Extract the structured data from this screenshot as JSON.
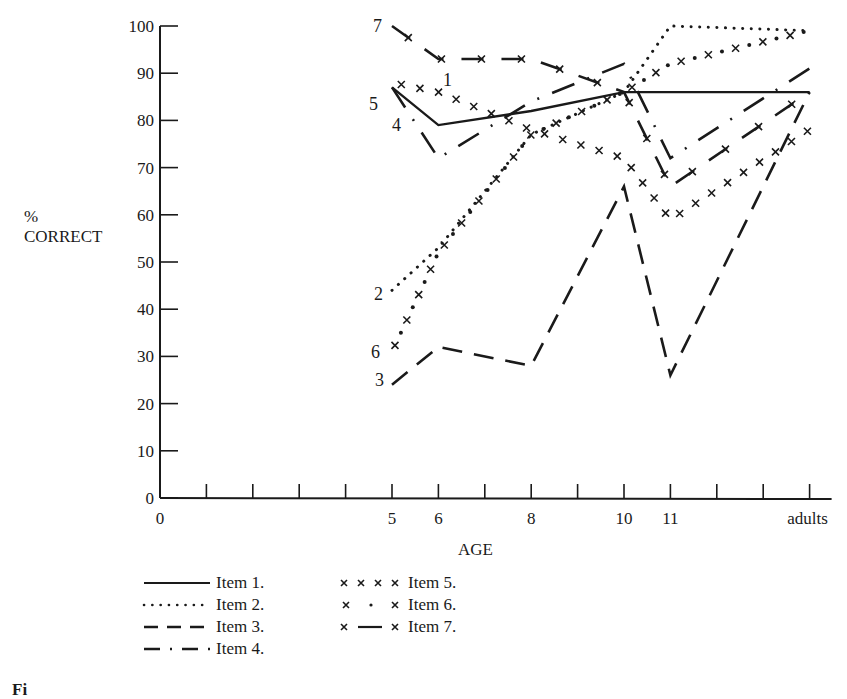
{
  "chart_data": {
    "type": "line",
    "title": "",
    "xlabel": "AGE",
    "ylabel": "% CORRECT",
    "ylabel_lines": [
      "%",
      "CORRECT"
    ],
    "ylim": [
      0,
      100
    ],
    "y_ticks": [
      0,
      10,
      20,
      30,
      40,
      50,
      60,
      70,
      80,
      90,
      100
    ],
    "x_tick_labels": [
      "0",
      "5",
      "6",
      "8",
      "10",
      "11",
      "adults"
    ],
    "categories": [
      "5",
      "6",
      "8",
      "10",
      "11",
      "adults"
    ],
    "grid": false,
    "legend_position": "bottom-left",
    "series": [
      {
        "name": "Item 1.",
        "label": "1",
        "style": "solid",
        "values": [
          87,
          79,
          82,
          86,
          86,
          86
        ]
      },
      {
        "name": "Item 2.",
        "label": "2",
        "style": "dotted",
        "values": [
          44,
          53,
          77,
          86,
          100,
          99
        ]
      },
      {
        "name": "Item 3.",
        "label": "3",
        "style": "dashed",
        "values": [
          24,
          32,
          28,
          66,
          26,
          86
        ]
      },
      {
        "name": "Item 4.",
        "label": "4",
        "style": "dash-dot",
        "values": [
          87,
          72,
          84,
          92,
          72,
          91
        ]
      },
      {
        "name": "Item 5.",
        "label": "5",
        "style": "x x x x",
        "values": [
          88,
          86,
          78,
          72,
          59,
          78
        ]
      },
      {
        "name": "Item 6.",
        "label": "6",
        "style": "x . x",
        "values": [
          31,
          52,
          77,
          86,
          92,
          99
        ]
      },
      {
        "name": "Item 7.",
        "label": "7",
        "style": "x - x",
        "values": [
          100,
          93,
          93,
          86,
          66,
          86
        ]
      }
    ]
  },
  "legend": {
    "left": [
      "Item 1.",
      "Item 2.",
      "Item 3.",
      "Item 4."
    ],
    "right": [
      "Item 5.",
      "Item 6.",
      "Item 7."
    ]
  },
  "axis": {
    "ylabel_pct": "%",
    "ylabel_word": "CORRECT",
    "xlabel": "AGE"
  },
  "caption_partial": "Fi"
}
